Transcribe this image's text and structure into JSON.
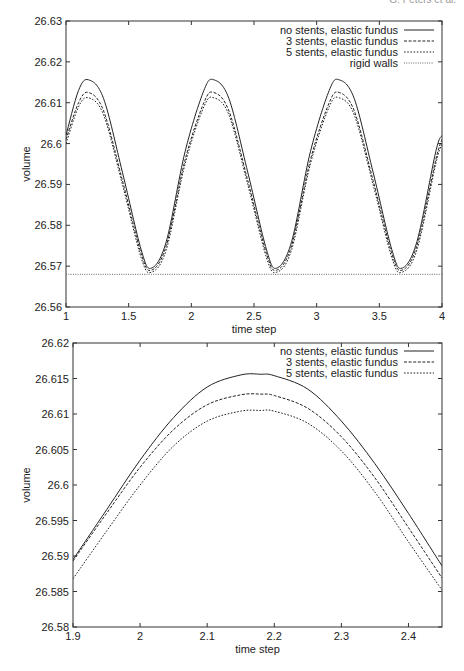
{
  "page": {
    "header_text": "G. Peters et al."
  },
  "chart_data": [
    {
      "type": "line",
      "title": "",
      "xlabel": "time step",
      "ylabel": "volume",
      "xlim": [
        1,
        4
      ],
      "ylim": [
        26.56,
        26.63
      ],
      "xticks": [
        "1",
        "1.5",
        "2",
        "2.5",
        "3",
        "3.5",
        "4"
      ],
      "yticks": [
        "26.56",
        "26.57",
        "26.58",
        "26.59",
        "26.6",
        "26.61",
        "26.62",
        "26.63"
      ],
      "grid": false,
      "legend_position": "top-right",
      "x": [
        1.0,
        1.1,
        1.18,
        1.3,
        1.45,
        1.6,
        1.68,
        1.8,
        1.95,
        2.1,
        2.18,
        2.3,
        2.45,
        2.6,
        2.68,
        2.8,
        2.95,
        3.1,
        3.18,
        3.3,
        3.45,
        3.6,
        3.68,
        3.8,
        3.95,
        4.0
      ],
      "series": [
        {
          "name": "no stents, elastic fundus",
          "style": "solid",
          "values": [
            26.602,
            26.613,
            26.6156,
            26.611,
            26.593,
            26.574,
            26.5695,
            26.576,
            26.598,
            26.613,
            26.6156,
            26.611,
            26.593,
            26.574,
            26.5695,
            26.576,
            26.598,
            26.613,
            26.6156,
            26.611,
            26.593,
            26.574,
            26.5695,
            26.576,
            26.598,
            26.602
          ]
        },
        {
          "name": "3 stents, elastic fundus",
          "style": "dashed",
          "values": [
            26.601,
            26.61,
            26.6125,
            26.608,
            26.591,
            26.573,
            26.569,
            26.575,
            26.596,
            26.61,
            26.6125,
            26.608,
            26.591,
            26.573,
            26.569,
            26.575,
            26.596,
            26.61,
            26.6125,
            26.608,
            26.591,
            26.573,
            26.569,
            26.575,
            26.596,
            26.601
          ]
        },
        {
          "name": "5 stents, elastic fundus",
          "style": "dotted",
          "values": [
            26.6,
            26.609,
            26.6112,
            26.607,
            26.59,
            26.572,
            26.5685,
            26.574,
            26.595,
            26.609,
            26.6112,
            26.607,
            26.59,
            26.572,
            26.5685,
            26.574,
            26.595,
            26.609,
            26.6112,
            26.607,
            26.59,
            26.572,
            26.5685,
            26.574,
            26.595,
            26.6
          ]
        },
        {
          "name": "rigid walls",
          "style": "fine-dotted",
          "values": [
            26.568,
            26.568,
            26.568,
            26.568,
            26.568,
            26.568,
            26.568,
            26.568,
            26.568,
            26.568,
            26.568,
            26.568,
            26.568,
            26.568,
            26.568,
            26.568,
            26.568,
            26.568,
            26.568,
            26.568,
            26.568,
            26.568,
            26.568,
            26.568,
            26.568,
            26.568
          ]
        }
      ]
    },
    {
      "type": "line",
      "title": "",
      "xlabel": "time step",
      "ylabel": "volume",
      "xlim": [
        1.9,
        2.45
      ],
      "ylim": [
        26.58,
        26.62
      ],
      "xticks": [
        "1.9",
        "2",
        "2.1",
        "2.2",
        "2.3",
        "2.4"
      ],
      "yticks": [
        "26.58",
        "26.585",
        "26.59",
        "26.595",
        "26.6",
        "26.605",
        "26.61",
        "26.615",
        "26.62"
      ],
      "grid": false,
      "legend_position": "top-right",
      "x": [
        1.9,
        1.95,
        2.0,
        2.05,
        2.1,
        2.15,
        2.18,
        2.2,
        2.25,
        2.3,
        2.35,
        2.4,
        2.45
      ],
      "series": [
        {
          "name": "no stents, elastic fundus",
          "style": "solid",
          "values": [
            26.5895,
            26.5965,
            26.6035,
            26.6095,
            26.6138,
            26.6155,
            26.6156,
            26.6154,
            26.6135,
            26.609,
            26.603,
            26.596,
            26.5886
          ]
        },
        {
          "name": "3 stents, elastic fundus",
          "style": "dashed",
          "values": [
            26.5893,
            26.596,
            26.6025,
            26.6078,
            26.6113,
            26.6127,
            26.6128,
            26.6126,
            26.6108,
            26.6068,
            26.601,
            26.594,
            26.5869
          ]
        },
        {
          "name": "5 stents, elastic fundus",
          "style": "dotted",
          "values": [
            26.5868,
            26.5935,
            26.6,
            26.6055,
            26.609,
            26.6104,
            26.6105,
            26.6104,
            26.6087,
            26.6048,
            26.599,
            26.592,
            26.5852
          ]
        }
      ]
    }
  ]
}
